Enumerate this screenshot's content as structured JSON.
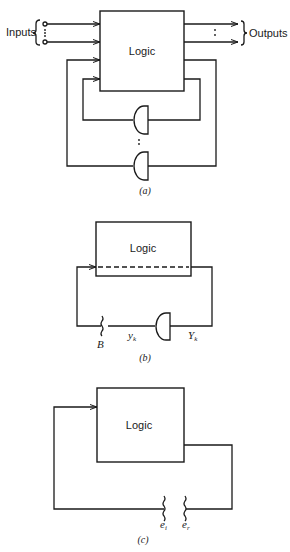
{
  "figure_a": {
    "logic_label": "Logic",
    "inputs_label": "Inputs",
    "outputs_label": "Outputs",
    "caption": "(a)"
  },
  "figure_b": {
    "logic_label": "Logic",
    "break_label": "B",
    "gate_input_label": "y",
    "gate_input_sub": "k",
    "gate_output_label": "Y",
    "gate_output_sub": "k",
    "caption": "(b)"
  },
  "figure_c": {
    "logic_label": "Logic",
    "left_break_label": "e",
    "left_break_sub": "i",
    "right_break_label": "e",
    "right_break_sub": "r",
    "caption": "(c)"
  },
  "colors": {
    "stroke": "#1a1a1a",
    "background": "#ffffff"
  }
}
